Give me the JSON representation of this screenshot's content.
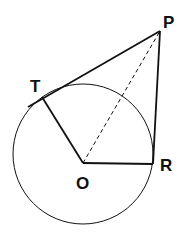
{
  "diagram": {
    "type": "geometry",
    "stroke_color": "#111111",
    "background": "#ffffff",
    "circle": {
      "center": "O",
      "cx": 83,
      "cy": 154,
      "r": 70
    },
    "points": {
      "P": {
        "label": "P",
        "x": 160,
        "y": 31
      },
      "T": {
        "label": "T",
        "x": 42,
        "y": 97
      },
      "O": {
        "label": "O",
        "x": 83,
        "y": 163
      },
      "R": {
        "label": "R",
        "x": 153,
        "y": 164
      }
    },
    "segments": [
      {
        "from": "P",
        "to": "T",
        "style": "solid",
        "note": "tangent line, extends past T"
      },
      {
        "from": "T",
        "to": "O",
        "style": "solid"
      },
      {
        "from": "O",
        "to": "R",
        "style": "solid"
      },
      {
        "from": "R",
        "to": "P",
        "style": "solid"
      },
      {
        "from": "O",
        "to": "P",
        "style": "dashed"
      }
    ]
  }
}
